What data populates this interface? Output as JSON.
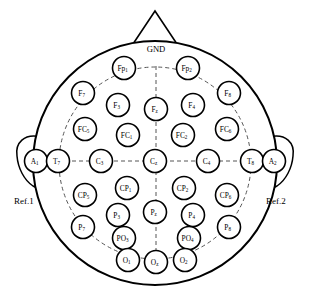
{
  "diagram": {
    "head": {
      "outline_color": "#000000",
      "fill_color": "#ffffff"
    },
    "nose": {
      "name": "nose-triangle"
    },
    "ground": {
      "label": "GND"
    },
    "references": [
      {
        "name": "ref-left",
        "label": "Ref.1"
      },
      {
        "name": "ref-right",
        "label": "Ref.2"
      }
    ],
    "guides": {
      "dashed_color": "#555555",
      "style": "dashed"
    },
    "electrodes": [
      {
        "id": "Fp1",
        "base": "Fp",
        "sub": "1",
        "cx": 124,
        "cy": 68,
        "r": 11.5
      },
      {
        "id": "Fp2",
        "base": "Fp",
        "sub": "2",
        "cx": 188,
        "cy": 68,
        "r": 11.5
      },
      {
        "id": "F7",
        "base": "F",
        "sub": "7",
        "cx": 83,
        "cy": 93,
        "r": 11.5
      },
      {
        "id": "F3",
        "base": "F",
        "sub": "3",
        "cx": 118,
        "cy": 105,
        "r": 11.5
      },
      {
        "id": "Fz",
        "base": "F",
        "sub": "z",
        "cx": 156,
        "cy": 109,
        "r": 11.5
      },
      {
        "id": "F4",
        "base": "F",
        "sub": "4",
        "cx": 193,
        "cy": 105,
        "r": 11.5
      },
      {
        "id": "F8",
        "base": "F",
        "sub": "8",
        "cx": 229,
        "cy": 93,
        "r": 11.5
      },
      {
        "id": "FC5",
        "base": "FC",
        "sub": "5",
        "cx": 85,
        "cy": 129,
        "r": 11.5
      },
      {
        "id": "FC1",
        "base": "FC",
        "sub": "1",
        "cx": 128,
        "cy": 135,
        "r": 11.5
      },
      {
        "id": "FC2",
        "base": "FC",
        "sub": "2",
        "cx": 183,
        "cy": 135,
        "r": 11.5
      },
      {
        "id": "FC6",
        "base": "FC",
        "sub": "6",
        "cx": 227,
        "cy": 129,
        "r": 11.5
      },
      {
        "id": "A1",
        "base": "A",
        "sub": "1",
        "cx": 36,
        "cy": 161,
        "r": 11.5
      },
      {
        "id": "T7",
        "base": "T",
        "sub": "7",
        "cx": 58,
        "cy": 161,
        "r": 11.5
      },
      {
        "id": "C3",
        "base": "C",
        "sub": "3",
        "cx": 101,
        "cy": 161,
        "r": 11.5
      },
      {
        "id": "Cz",
        "base": "C",
        "sub": "z",
        "cx": 155,
        "cy": 161,
        "r": 11.5
      },
      {
        "id": "C4",
        "base": "C",
        "sub": "4",
        "cx": 208,
        "cy": 161,
        "r": 11.5
      },
      {
        "id": "T8",
        "base": "T",
        "sub": "8",
        "cx": 252,
        "cy": 161,
        "r": 11.5
      },
      {
        "id": "A2",
        "base": "A",
        "sub": "2",
        "cx": 274,
        "cy": 161,
        "r": 11.5
      },
      {
        "id": "CP5",
        "base": "CP",
        "sub": "5",
        "cx": 85,
        "cy": 195,
        "r": 11.5
      },
      {
        "id": "CP1",
        "base": "CP",
        "sub": "1",
        "cx": 127,
        "cy": 188,
        "r": 11.5
      },
      {
        "id": "CP2",
        "base": "CP",
        "sub": "2",
        "cx": 184,
        "cy": 188,
        "r": 11.5
      },
      {
        "id": "CP6",
        "base": "CP",
        "sub": "6",
        "cx": 227,
        "cy": 195,
        "r": 11.5
      },
      {
        "id": "P7",
        "base": "P",
        "sub": "7",
        "cx": 83,
        "cy": 227,
        "r": 11.5
      },
      {
        "id": "P3",
        "base": "P",
        "sub": "3",
        "cx": 118,
        "cy": 215,
        "r": 11.5
      },
      {
        "id": "Pz",
        "base": "P",
        "sub": "z",
        "cx": 155,
        "cy": 212,
        "r": 11.5
      },
      {
        "id": "P4",
        "base": "P",
        "sub": "4",
        "cx": 193,
        "cy": 215,
        "r": 11.5
      },
      {
        "id": "P8",
        "base": "P",
        "sub": "8",
        "cx": 229,
        "cy": 227,
        "r": 11.5
      },
      {
        "id": "PO3",
        "base": "PO",
        "sub": "3",
        "cx": 124,
        "cy": 238,
        "r": 11.5
      },
      {
        "id": "PO4",
        "base": "PO",
        "sub": "4",
        "cx": 189,
        "cy": 238,
        "r": 11.5
      },
      {
        "id": "O1",
        "base": "O",
        "sub": "1",
        "cx": 128,
        "cy": 260,
        "r": 11.5
      },
      {
        "id": "Oz",
        "base": "O",
        "sub": "z",
        "cx": 156,
        "cy": 262,
        "r": 11.5
      },
      {
        "id": "O2",
        "base": "O",
        "sub": "2",
        "cx": 185,
        "cy": 260,
        "r": 11.5
      }
    ]
  }
}
